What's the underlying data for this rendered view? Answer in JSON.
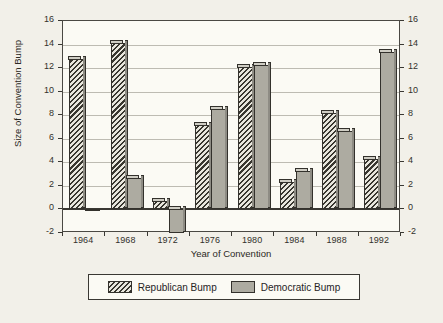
{
  "chart_data": {
    "type": "bar",
    "title": "",
    "xlabel": "Year of Convention",
    "ylabel": "Size of Convention Bump",
    "categories": [
      "1964",
      "1968",
      "1972",
      "1976",
      "1980",
      "1984",
      "1988",
      "1992"
    ],
    "series": [
      {
        "name": "Republican Bump",
        "values": [
          12.8,
          14.1,
          0.7,
          7.2,
          12.1,
          2.3,
          8.2,
          4.3
        ]
      },
      {
        "name": "Democratic Bump",
        "values": [
          0.0,
          2.7,
          -2.0,
          8.5,
          12.3,
          3.3,
          6.7,
          13.4
        ]
      }
    ],
    "ylim": [
      -2,
      16
    ],
    "yticks": [
      "16",
      "14",
      "12",
      "10",
      "8",
      "6",
      "4",
      "2",
      "0",
      "-2"
    ],
    "ytick_values": [
      16,
      14,
      12,
      10,
      8,
      6,
      4,
      2,
      0,
      -2
    ],
    "right_axis_mirrored": true,
    "grid": true,
    "legend_position": "bottom"
  },
  "legend": {
    "entries": [
      {
        "label": "Republican Bump",
        "pattern": "diagonal-hatch",
        "color": "#a9a79e"
      },
      {
        "label": "Democratic Bump",
        "pattern": "dotted-solid",
        "color": "#adaba1"
      }
    ]
  },
  "colors": {
    "paper": "#f2f0e9",
    "plot_background": "#fbfaf4",
    "axis": "#3a3833",
    "grid": "#bdbbb2",
    "republican": "#a9a79e",
    "democratic": "#adaba1"
  }
}
